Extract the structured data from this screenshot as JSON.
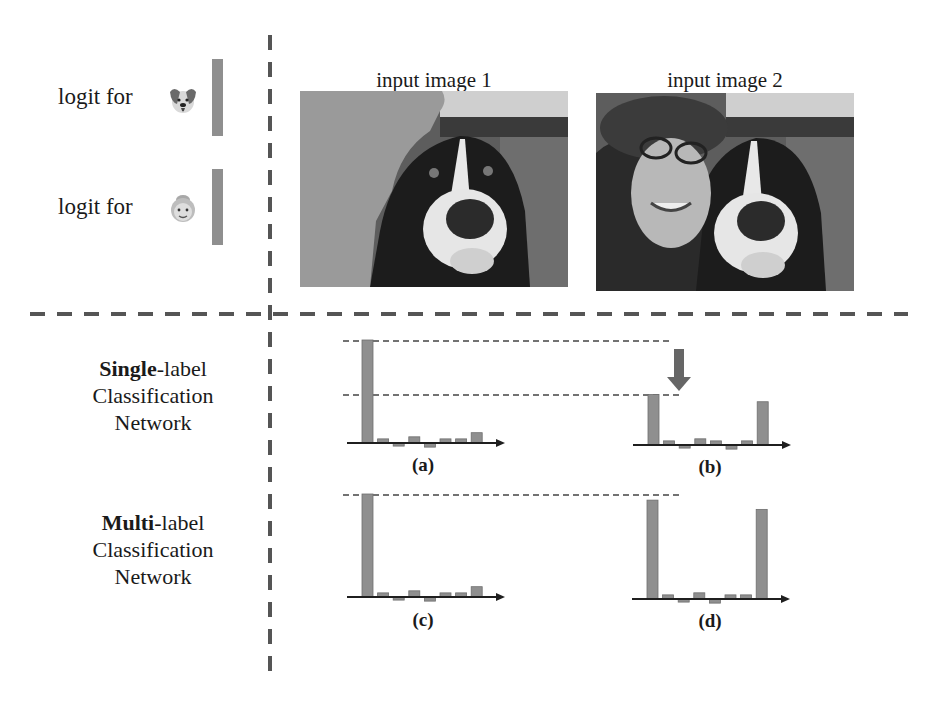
{
  "top_left": {
    "logits": [
      {
        "label": "logit for",
        "icon": "dog-face-icon",
        "bar_top": 59,
        "bar_height": 77
      },
      {
        "label": "logit for",
        "icon": "old-woman-face-icon",
        "bar_top": 169,
        "bar_height": 76
      }
    ]
  },
  "inputs": [
    {
      "title": "input image 1",
      "description": "dog photo with the person region masked in gray"
    },
    {
      "title": "input image 2",
      "description": "photo of a woman with a hat and glasses next to a dog"
    }
  ],
  "rows": [
    {
      "bold": "Single",
      "rest": "-label",
      "line2": "Classification",
      "line3": "Network"
    },
    {
      "bold": "Multi",
      "rest": "-label",
      "line2": "Classification",
      "line3": "Network"
    }
  ],
  "captions": {
    "a": "(a)",
    "b": "(b)",
    "c": "(c)",
    "d": "(d)"
  },
  "colors": {
    "bar": "#8f8f8f",
    "axis": "#1f1f1f",
    "dash": "#555555",
    "arrow": "#666666"
  },
  "chart_data": [
    {
      "type": "bar",
      "title": "(a) Single-label network, input image 1",
      "categories": [
        "c1",
        "c2",
        "c3",
        "c4",
        "c5",
        "c6",
        "c7",
        "c8"
      ],
      "values": [
        10,
        0.4,
        -0.3,
        0.6,
        -0.4,
        0.4,
        0.4,
        1.0
      ],
      "xlabel": "",
      "ylabel": "logit",
      "grid": false,
      "legend": null
    },
    {
      "type": "bar",
      "title": "(b) Single-label network, input image 2",
      "categories": [
        "c1",
        "c2",
        "c3",
        "c4",
        "c5",
        "c6",
        "c7",
        "c8"
      ],
      "values": [
        4.9,
        0.4,
        -0.3,
        0.6,
        0.4,
        -0.4,
        0.4,
        4.2
      ],
      "xlabel": "",
      "ylabel": "logit",
      "grid": false,
      "legend": null,
      "annotations": [
        "down arrow indicating the dog logit decreases relative to (a)"
      ]
    },
    {
      "type": "bar",
      "title": "(c) Multi-label network, input image 1",
      "categories": [
        "c1",
        "c2",
        "c3",
        "c4",
        "c5",
        "c6",
        "c7",
        "c8"
      ],
      "values": [
        10,
        0.4,
        -0.3,
        0.6,
        -0.4,
        0.4,
        0.4,
        1.0
      ],
      "xlabel": "",
      "ylabel": "logit",
      "grid": false,
      "legend": null
    },
    {
      "type": "bar",
      "title": "(d) Multi-label network, input image 2",
      "categories": [
        "c1",
        "c2",
        "c3",
        "c4",
        "c5",
        "c6",
        "c7",
        "c8"
      ],
      "values": [
        9.6,
        0.4,
        -0.3,
        0.6,
        -0.4,
        0.4,
        0.4,
        8.7
      ],
      "xlabel": "",
      "ylabel": "logit",
      "grid": false,
      "legend": null
    }
  ]
}
